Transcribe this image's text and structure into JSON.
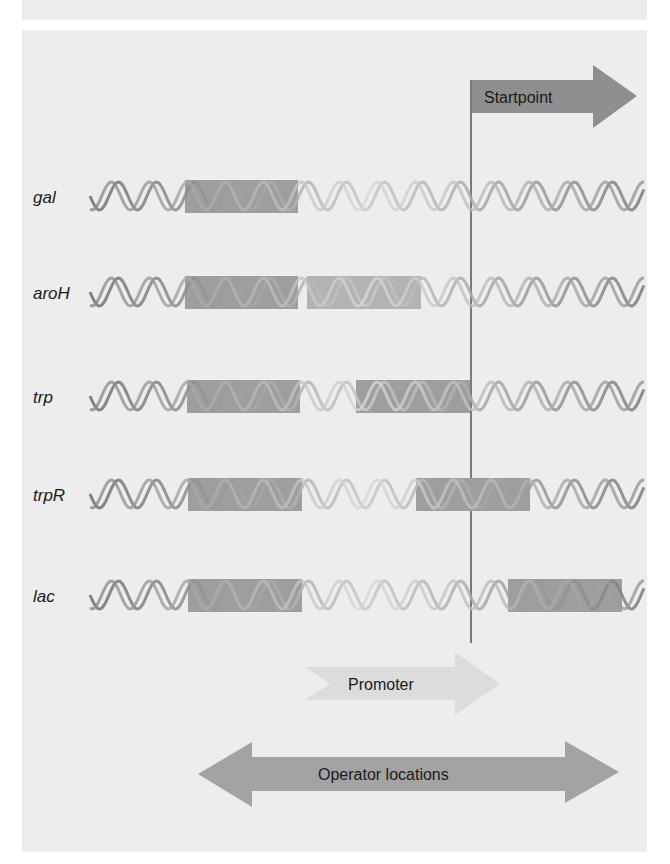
{
  "diagram": {
    "startpoint": {
      "label": "Startpoint",
      "x": 471
    },
    "promoter": {
      "label": "Promoter"
    },
    "operator": {
      "label": "Operator locations"
    },
    "genes": [
      {
        "name": "gal",
        "y": 196,
        "operators": [
          {
            "x1": 185,
            "x2": 298,
            "shade": "dark"
          }
        ]
      },
      {
        "name": "aroH",
        "y": 292,
        "operators": [
          {
            "x1": 185,
            "x2": 298,
            "shade": "dark"
          },
          {
            "x1": 307,
            "x2": 421,
            "shade": "light"
          }
        ]
      },
      {
        "name": "trp",
        "y": 396,
        "operators": [
          {
            "x1": 187,
            "x2": 300,
            "shade": "dark"
          },
          {
            "x1": 356,
            "x2": 470,
            "shade": "dark"
          }
        ]
      },
      {
        "name": "trpR",
        "y": 494,
        "operators": [
          {
            "x1": 188,
            "x2": 302,
            "shade": "dark"
          },
          {
            "x1": 416,
            "x2": 530,
            "shade": "dark"
          }
        ]
      },
      {
        "name": "lac",
        "y": 595,
        "operators": [
          {
            "x1": 188,
            "x2": 302,
            "shade": "dark"
          },
          {
            "x1": 508,
            "x2": 622,
            "shade": "dark"
          }
        ]
      }
    ],
    "colors": {
      "panel": "#ededed",
      "operator_dark": "#9e9e9e",
      "operator_light": "#b3b3b3",
      "startpoint_arrow": "#8f8f8f",
      "promoter_arrow": "#dcdcdc",
      "operator_arrow": "#a3a3a3",
      "line": "#7a7a7a"
    }
  }
}
